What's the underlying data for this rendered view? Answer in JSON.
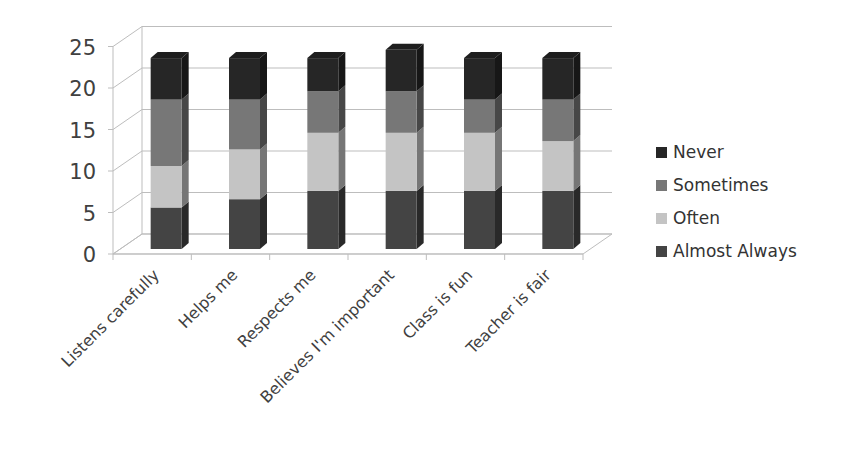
{
  "chart_data": {
    "type": "bar",
    "variant": "stacked-3d",
    "title": "",
    "xlabel": "",
    "ylabel": "",
    "ylim": [
      0,
      25
    ],
    "yticks": [
      0,
      5,
      10,
      15,
      20,
      25
    ],
    "grid": true,
    "legend_position": "right",
    "categories": [
      "Listens carefully",
      "Helps me",
      "Respects me",
      "Believes I'm important",
      "Class is fun",
      "Teacher is fair"
    ],
    "series": [
      {
        "name": "Almost Always",
        "color": "#444444",
        "values": [
          5,
          6,
          7,
          7,
          7,
          7
        ]
      },
      {
        "name": "Often",
        "color": "#c4c4c4",
        "values": [
          5,
          6,
          7,
          7,
          7,
          6
        ]
      },
      {
        "name": "Sometimes",
        "color": "#777777",
        "values": [
          8,
          6,
          5,
          5,
          4,
          5
        ]
      },
      {
        "name": "Never",
        "color": "#262626",
        "values": [
          5,
          5,
          4,
          5,
          5,
          5
        ]
      }
    ],
    "legend_order": [
      "Never",
      "Sometimes",
      "Often",
      "Almost Always"
    ]
  }
}
